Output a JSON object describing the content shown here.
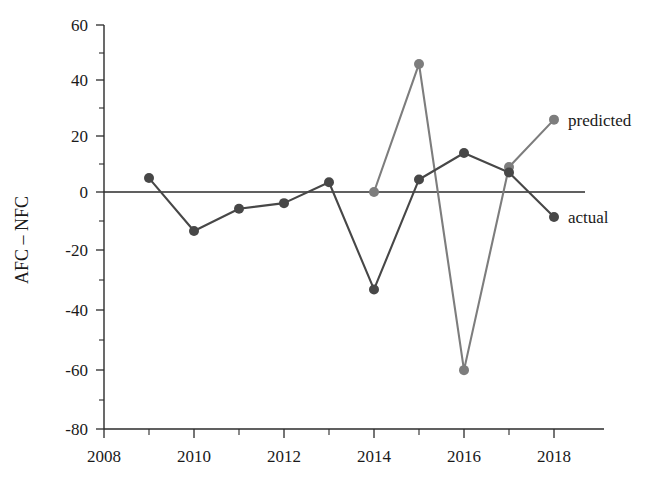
{
  "chart_data": {
    "type": "line",
    "title": "",
    "xlabel": "",
    "ylabel": "AFC – NFC",
    "x": [
      2009,
      2010,
      2011,
      2012,
      2013,
      2014,
      2015,
      2016,
      2017,
      2018
    ],
    "xlim": [
      2008,
      2018
    ],
    "ylim": [
      -80,
      60
    ],
    "xticks": [
      2008,
      2009,
      2010,
      2011,
      2012,
      2013,
      2014,
      2015,
      2016,
      2017,
      2018
    ],
    "xtick_labels": [
      "2008",
      "",
      "2010",
      "",
      "2012",
      "",
      "2014",
      "",
      "2016",
      "",
      "2018"
    ],
    "yticks": [
      60,
      50,
      40,
      30,
      20,
      10,
      0,
      -10,
      -20,
      -30,
      -40,
      -50,
      -60,
      -70,
      -80
    ],
    "ytick_labels": [
      "60",
      "",
      "40",
      "",
      "20",
      "",
      "0",
      "",
      "-20",
      "",
      "-40",
      "",
      "-60",
      "",
      "-80"
    ],
    "grid": false,
    "legend_position": "inline-right-annotations",
    "zero_reference_line": 0,
    "series": [
      {
        "name": "predicted",
        "color": "#7d7d7d",
        "marker": "circle",
        "x": [
          2014,
          2015,
          2016,
          2017,
          2018
        ],
        "values": [
          0,
          46,
          -64,
          9,
          26
        ]
      },
      {
        "name": "actual",
        "color": "#474747",
        "marker": "circle",
        "x": [
          2009,
          2010,
          2011,
          2012,
          2013,
          2014,
          2015,
          2016,
          2017,
          2018
        ],
        "values": [
          5,
          -14,
          -6,
          -4,
          3.5,
          -35,
          4.5,
          14,
          7,
          -9
        ]
      }
    ],
    "annotations": [
      {
        "text": "predicted",
        "x": 2018,
        "y": 26
      },
      {
        "text": "actual",
        "x": 2018,
        "y": -9
      }
    ]
  },
  "axes": {
    "y_title": "AFC – NFC",
    "y_tick_labels": [
      "60",
      "40",
      "20",
      "0",
      "-20",
      "-40",
      "-60",
      "-80"
    ],
    "x_tick_labels": [
      "2008",
      "2010",
      "2012",
      "2014",
      "2016",
      "2018"
    ]
  },
  "labels": {
    "predicted": "predicted",
    "actual": "actual"
  },
  "colors": {
    "predicted": "#7d7d7d",
    "actual": "#474747",
    "axis": "#2b2b2b",
    "text": "#1a1a1a",
    "background": "#ffffff"
  }
}
